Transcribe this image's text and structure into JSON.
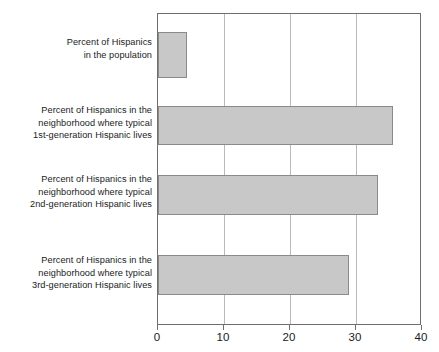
{
  "chart_data": {
    "type": "bar",
    "orientation": "horizontal",
    "title": "",
    "xlabel": "",
    "ylabel": "",
    "xlim": [
      0,
      40
    ],
    "xticks": [
      0,
      10,
      20,
      30,
      40
    ],
    "xtick_labels": [
      "0",
      "10",
      "20",
      "30",
      "40"
    ],
    "grid": "vertical-gridlines-at-10-20-30",
    "legend": "none",
    "bar_color": "#c8c8c8",
    "bar_edge_color": "#8a8a8a",
    "axis_color": "#6e6e6e",
    "gridline_color": "#b9b9b9",
    "categories": [
      "Percent of Hispanics\nin the population",
      "Percent of Hispanics in the\nneighborhood where typical\n1st-generation Hispanic lives",
      "Percent of Hispanics in the\nneighborhood where typical\n2nd-generation Hispanic lives",
      "Percent of Hispanics in the\nneighborhood where typical\n3rd-generation Hispanic lives"
    ],
    "values": [
      4.4,
      35.6,
      33.3,
      29.0
    ]
  },
  "bars": [
    {
      "label": "Percent of Hispanics\nin the population",
      "value": 4.4,
      "label_top": 36,
      "bar_top": 19,
      "bar_height": 46
    },
    {
      "label": "Percent of Hispanics in the\nneighborhood where typical\n1st-generation Hispanic lives",
      "value": 35.6,
      "label_top": 104,
      "bar_top": 93,
      "bar_height": 39
    },
    {
      "label": "Percent of Hispanics in the\nneighborhood where typical\n2nd-generation Hispanic lives",
      "value": 33.3,
      "label_top": 173,
      "bar_top": 162,
      "bar_height": 40
    },
    {
      "label": "Percent of Hispanics in the\nneighborhood where typical\n3rd-generation Hispanic lives",
      "value": 29.0,
      "label_top": 254,
      "bar_top": 242,
      "bar_height": 40
    }
  ],
  "axis": {
    "ticks": [
      {
        "label": "0",
        "x": 157
      },
      {
        "label": "10",
        "x": 223
      },
      {
        "label": "20",
        "x": 289
      },
      {
        "label": "30",
        "x": 355
      },
      {
        "label": "40",
        "x": 421
      }
    ],
    "gridlines_x": [
      66,
      132,
      198
    ]
  }
}
